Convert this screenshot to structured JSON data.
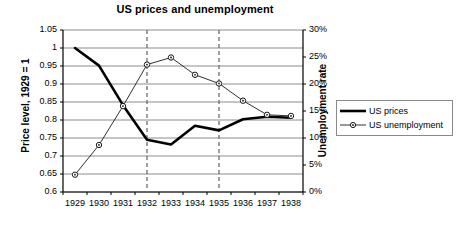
{
  "chart_data": {
    "type": "line",
    "title": "US prices and unemployment",
    "xlabel": "",
    "categories": [
      "1929",
      "1930",
      "1931",
      "1932",
      "1933",
      "1934",
      "1935",
      "1936",
      "1937",
      "1938"
    ],
    "grid": true,
    "legend_position": "right",
    "axes": {
      "left": {
        "label": "Price level, 1929 = 1",
        "ylim": [
          0.6,
          1.05
        ],
        "ticks": [
          "0.6",
          "0.65",
          "0.7",
          "0.75",
          "0.8",
          "0.85",
          "0.9",
          "0.95",
          "1",
          "1.05"
        ],
        "tick_values": [
          0.6,
          0.65,
          0.7,
          0.75,
          0.8,
          0.85,
          0.9,
          0.95,
          1.0,
          1.05
        ]
      },
      "right": {
        "label": "Unemployment rate",
        "ylim": [
          0,
          30
        ],
        "ticks": [
          "0%",
          "5%",
          "10%",
          "15%",
          "20%",
          "25%",
          "30%"
        ],
        "tick_values": [
          0,
          5,
          10,
          15,
          20,
          25,
          30
        ]
      }
    },
    "series": [
      {
        "name": "US prices",
        "axis": "left",
        "style": "thick-solid",
        "markers": false,
        "values": [
          1.0,
          0.951,
          0.841,
          0.745,
          0.732,
          0.784,
          0.771,
          0.802,
          0.809,
          0.806
        ]
      },
      {
        "name": "US unemployment",
        "axis": "right",
        "style": "thin-solid",
        "markers": true,
        "values": [
          3.2,
          8.7,
          15.9,
          23.6,
          24.9,
          21.7,
          20.1,
          16.9,
          14.3,
          14.1
        ]
      }
    ],
    "annotations": [
      {
        "type": "vertical-dashed-line",
        "at": "1932"
      },
      {
        "type": "vertical-dashed-line",
        "at": "1935"
      }
    ]
  },
  "legend": {
    "items": [
      {
        "label": "US prices"
      },
      {
        "label": "US unemployment"
      }
    ]
  },
  "colors": {
    "series_prices": "#000000",
    "series_unemployment": "#1a1a1a",
    "grid": "#808080",
    "axis": "#000000",
    "annotation": "#6e6e6e",
    "background": "#ffffff"
  }
}
